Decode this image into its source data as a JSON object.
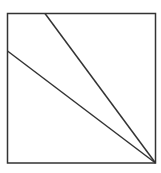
{
  "diagram": {
    "stroke_color": "#333333",
    "background": "#ffffff",
    "square": {
      "x": 7.5,
      "y": 13.5,
      "width": 148,
      "height": 149.5
    },
    "lines": [
      {
        "name": "line-from-top",
        "x1": 45,
        "y1": 13.5,
        "x2": 155.5,
        "y2": 163
      },
      {
        "name": "line-from-left",
        "x1": 7.5,
        "y1": 51,
        "x2": 155.5,
        "y2": 163
      }
    ]
  }
}
